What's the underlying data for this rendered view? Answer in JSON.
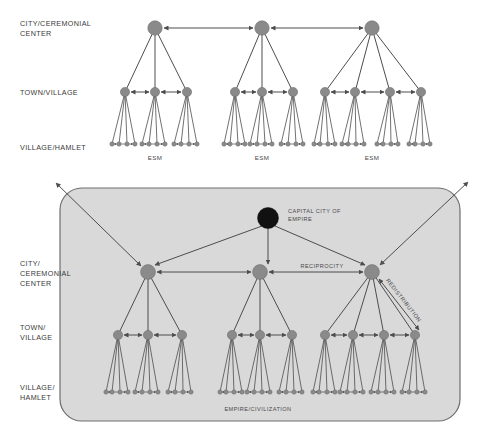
{
  "diagram": {
    "title_hidden": "",
    "colors": {
      "node_gray": "#8a8a8a",
      "node_stroke": "#6e6e6e",
      "node_black": "#111111",
      "line": "#4d4d4d",
      "panel_fill": "#d9d9d9",
      "panel_stroke": "#6e6e6e",
      "text": "#3a3a3a",
      "background": "#ffffff"
    },
    "top_section": {
      "row_labels": [
        {
          "id": "city",
          "text": "CITY/CEREMONIAL CENTER",
          "lines": [
            "CITY/CEREMONIAL",
            "CENTER"
          ]
        },
        {
          "id": "town",
          "text": "TOWN/VILLAGE",
          "lines": [
            "TOWN/VILLAGE"
          ]
        },
        {
          "id": "hamlet",
          "text": "VILLAGE/HAMLET",
          "lines": [
            "VILLAGE/HAMLET"
          ]
        }
      ],
      "clusters": [
        {
          "id": "esm-1",
          "caption": "ESM",
          "town_count": 3
        },
        {
          "id": "esm-2",
          "caption": "ESM",
          "town_count": 3
        },
        {
          "id": "esm-3",
          "caption": "ESM",
          "town_count": 4
        }
      ],
      "peer_link_style": "double-headed-arrow"
    },
    "bottom_section": {
      "panel_caption": "EMPIRE/CIVILIZATION",
      "capital_label": {
        "lines": [
          "CAPITAL CITY OF",
          "EMPIRE"
        ],
        "text": "CAPITAL CITY OF EMPIRE"
      },
      "row_labels": [
        {
          "id": "city",
          "text": "CITY/ CEREMONIAL CENTER",
          "lines": [
            "CITY/",
            "CEREMONIAL",
            "CENTER"
          ]
        },
        {
          "id": "town",
          "text": "TOWN/ VILLAGE",
          "lines": [
            "TOWN/",
            "VILLAGE"
          ]
        },
        {
          "id": "hamlet",
          "text": "VILLAGE/ HAMLET",
          "lines": [
            "VILLAGE/",
            "HAMLET"
          ]
        }
      ],
      "clusters": [
        {
          "id": "emp-1",
          "town_count": 3
        },
        {
          "id": "emp-2",
          "town_count": 3
        },
        {
          "id": "emp-3",
          "town_count": 4
        }
      ],
      "edge_labels": [
        {
          "id": "reciprocity",
          "text": "RECIPROCITY"
        },
        {
          "id": "redistribution",
          "text": "REDISTRIBUTION"
        }
      ],
      "external_arrows": 2
    }
  }
}
